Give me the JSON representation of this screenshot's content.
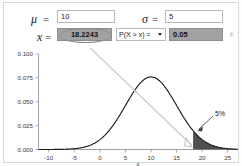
{
  "panel": {
    "mu": {
      "symbol": "μ",
      "equals": "=",
      "value": "10"
    },
    "sigma": {
      "symbol": "σ",
      "equals": "=",
      "value": "5"
    },
    "x": {
      "symbol": "x",
      "equals": "=",
      "value": "18.2243"
    },
    "probability_selector": {
      "selected": "P(X > x) =",
      "caret": "chevron-down-icon",
      "options": [
        "P(X > x) =",
        "P(X < x) =",
        "P(x1 < X < x2) ="
      ]
    },
    "probability_value": "0.05",
    "pointer_glyph": "♁"
  },
  "chart_data": {
    "type": "line",
    "title": "",
    "xlabel": "x",
    "ylabel": "",
    "xlim": [
      -12,
      27
    ],
    "ylim": [
      0,
      0.105
    ],
    "xticks": [
      "-10",
      "-5",
      "0",
      "5",
      "10",
      "15",
      "20",
      "25"
    ],
    "xtick_values": [
      -10,
      -5,
      0,
      5,
      10,
      15,
      20,
      25
    ],
    "yticks": [
      "0.000",
      "0.025",
      "0.050",
      "0.075",
      "0.100"
    ],
    "ytick_values": [
      0.0,
      0.025,
      0.05,
      0.075,
      0.1
    ],
    "grid": false,
    "legend": false,
    "distribution": {
      "name": "normal",
      "mean": 10,
      "sd": 5,
      "peak_density": 0.0798
    },
    "shaded_region": {
      "from": 18.2243,
      "to": 27,
      "area": 0.05,
      "label": "5%",
      "color": "#4f4f4f"
    },
    "annotations": [
      {
        "text": "5%",
        "x": 21.5,
        "y": 0.0255
      }
    ]
  }
}
